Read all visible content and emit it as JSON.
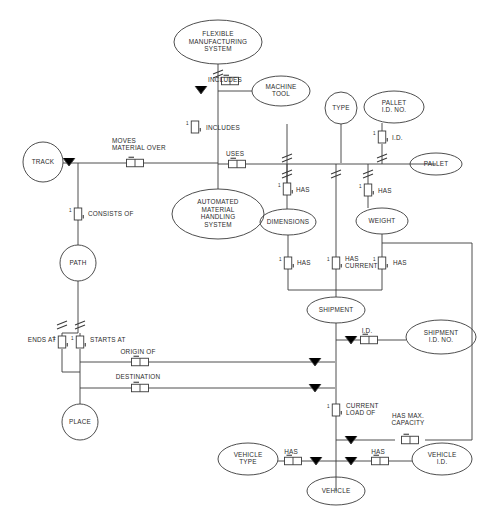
{
  "diagram": {
    "type": "entity-relationship-diagram",
    "notation": "NIAM / ORM fact-based model",
    "stroke_color": "#3a3a3a",
    "background_color": "#ffffff",
    "entities": [
      {
        "id": "fms",
        "label": "FLEXIBLE\nMANUFACTURING\nSYSTEM",
        "lines": [
          "FLEXIBLE",
          "MANUFACTURING",
          "SYSTEM"
        ],
        "shape": "ellipse",
        "cx": 218,
        "cy": 42,
        "rx": 44,
        "ry": 22
      },
      {
        "id": "machine_tool",
        "label": "MACHINE\nTOOL",
        "lines": [
          "MACHINE",
          "TOOL"
        ],
        "shape": "ellipse",
        "cx": 281,
        "cy": 91,
        "rx": 29,
        "ry": 15
      },
      {
        "id": "track",
        "label": "TRACK",
        "lines": [
          "TRACK"
        ],
        "shape": "circle",
        "cx": 43,
        "cy": 162,
        "rx": 20,
        "ry": 20
      },
      {
        "id": "amhs",
        "label": "AUTOMATED\nMATERIAL\nHANDLING\nSYSTEM",
        "lines": [
          "AUTOMATED",
          "MATERIAL",
          "HANDLING",
          "SYSTEM"
        ],
        "shape": "ellipse",
        "cx": 218,
        "cy": 214,
        "rx": 46,
        "ry": 25
      },
      {
        "id": "path",
        "label": "PATH",
        "lines": [
          "PATH"
        ],
        "shape": "circle",
        "cx": 78,
        "cy": 263,
        "rx": 18,
        "ry": 18
      },
      {
        "id": "place",
        "label": "PLACE",
        "lines": [
          "PLACE"
        ],
        "shape": "circle",
        "cx": 80,
        "cy": 422,
        "rx": 18,
        "ry": 18
      },
      {
        "id": "type",
        "label": "TYPE",
        "lines": [
          "TYPE"
        ],
        "shape": "circle",
        "cx": 341,
        "cy": 108,
        "rx": 16,
        "ry": 16
      },
      {
        "id": "pallet_id_no",
        "label": "PALLET\nI.D. NO.",
        "lines": [
          "PALLET",
          "I.D. NO."
        ],
        "shape": "ellipse",
        "cx": 394,
        "cy": 107,
        "rx": 30,
        "ry": 16
      },
      {
        "id": "pallet",
        "label": "PALLET",
        "lines": [
          "PALLET"
        ],
        "shape": "ellipse",
        "cx": 436,
        "cy": 164,
        "rx": 26,
        "ry": 11
      },
      {
        "id": "dimensions",
        "label": "DIMENSIONS",
        "lines": [
          "DIMENSIONS"
        ],
        "shape": "ellipse",
        "cx": 288,
        "cy": 222,
        "rx": 28,
        "ry": 13
      },
      {
        "id": "weight",
        "label": "WEIGHT",
        "lines": [
          "WEIGHT"
        ],
        "shape": "ellipse",
        "cx": 382,
        "cy": 221,
        "rx": 26,
        "ry": 13
      },
      {
        "id": "shipment",
        "label": "SHIPMENT",
        "lines": [
          "SHIPMENT"
        ],
        "shape": "ellipse",
        "cx": 336,
        "cy": 310,
        "rx": 29,
        "ry": 13
      },
      {
        "id": "shipment_id_no",
        "label": "SHIPMENT\nI.D. NO.",
        "lines": [
          "SHIPMENT",
          "I.D. NO."
        ],
        "shape": "ellipse",
        "cx": 441,
        "cy": 337,
        "rx": 35,
        "ry": 17
      },
      {
        "id": "vehicle_type",
        "label": "VEHICLE\nTYPE",
        "lines": [
          "VEHICLE",
          "TYPE"
        ],
        "shape": "ellipse",
        "cx": 248,
        "cy": 459,
        "rx": 30,
        "ry": 16
      },
      {
        "id": "vehicle_id",
        "label": "VEHICLE\nI.D.",
        "lines": [
          "VEHICLE",
          "I.D."
        ],
        "shape": "ellipse",
        "cx": 442,
        "cy": 459,
        "rx": 30,
        "ry": 16
      },
      {
        "id": "vehicle",
        "label": "VEHICLE",
        "lines": [
          "VEHICLE"
        ],
        "shape": "ellipse",
        "cx": 336,
        "cy": 491,
        "rx": 29,
        "ry": 14
      }
    ],
    "predicates": [
      {
        "id": "includes_machine_tool",
        "label": "INCLUDES",
        "lines": [
          "INCLUDES"
        ],
        "x": 230,
        "y": 81,
        "label_x": 225,
        "label_y": 80,
        "anchor": "middle",
        "boxes": 2,
        "orient": "h"
      },
      {
        "id": "includes_amhs",
        "label": "INCLUDES",
        "lines": [
          "INCLUDES"
        ],
        "x": 195,
        "y": 127,
        "label_x": 206,
        "label_y": 128,
        "anchor": "start",
        "boxes": 1,
        "orient": "v"
      },
      {
        "id": "moves_material_over",
        "label": "MOVES\nMATERIAL OVER",
        "lines": [
          "MOVES",
          "MATERIAL  OVER"
        ],
        "x": 135,
        "y": 163,
        "label_x": 112,
        "label_y": 145,
        "anchor": "start",
        "boxes": 2,
        "orient": "h"
      },
      {
        "id": "uses",
        "label": "USES",
        "lines": [
          "USES"
        ],
        "x": 237,
        "y": 164,
        "label_x": 235,
        "label_y": 154,
        "anchor": "middle",
        "boxes": 2,
        "orient": "h"
      },
      {
        "id": "consists_of",
        "label": "CONSISTS OF",
        "lines": [
          "CONSISTS OF"
        ],
        "x": 78,
        "y": 214,
        "label_x": 88,
        "label_y": 214,
        "anchor": "start",
        "boxes": 1,
        "orient": "v"
      },
      {
        "id": "has_type",
        "label": "HAS",
        "lines": [
          "HAS"
        ],
        "x": 287,
        "y": 189,
        "label_x": 296,
        "label_y": 190,
        "anchor": "start",
        "boxes": 1,
        "orient": "v"
      },
      {
        "id": "has_id",
        "label": "I.D.",
        "lines": [
          "I.D."
        ],
        "x": 382,
        "y": 137,
        "label_x": 392,
        "label_y": 138,
        "anchor": "start",
        "boxes": 1,
        "orient": "v"
      },
      {
        "id": "has_weight",
        "label": "HAS",
        "lines": [
          "HAS"
        ],
        "x": 368,
        "y": 190,
        "label_x": 378,
        "label_y": 191,
        "anchor": "start",
        "boxes": 1,
        "orient": "v"
      },
      {
        "id": "has_dimensions",
        "label": "HAS",
        "lines": [
          "HAS"
        ],
        "x": 288,
        "y": 263,
        "label_x": 297,
        "label_y": 263,
        "anchor": "start",
        "boxes": 1,
        "orient": "v"
      },
      {
        "id": "has_current",
        "label": "HAS\nCURRENT",
        "lines": [
          "HAS",
          "CURRENT"
        ],
        "x": 336,
        "y": 263,
        "label_x": 345,
        "label_y": 263,
        "anchor": "start",
        "boxes": 1,
        "orient": "v"
      },
      {
        "id": "has_weight_2",
        "label": "HAS",
        "lines": [
          "HAS"
        ],
        "x": 382,
        "y": 263,
        "label_x": 393,
        "label_y": 263,
        "anchor": "start",
        "boxes": 1,
        "orient": "v"
      },
      {
        "id": "shipment_id",
        "label": "I.D.",
        "lines": [
          "I.D."
        ],
        "x": 369,
        "y": 340,
        "label_x": 367,
        "label_y": 331,
        "anchor": "middle",
        "boxes": 2,
        "orient": "h"
      },
      {
        "id": "ends_at",
        "label": "ENDS AT",
        "lines": [
          "ENDS AT"
        ],
        "x": 62,
        "y": 342,
        "label_x": 56,
        "label_y": 340,
        "anchor": "end",
        "boxes": 1,
        "orient": "v"
      },
      {
        "id": "starts_at",
        "label": "STARTS AT",
        "lines": [
          "STARTS AT"
        ],
        "x": 80,
        "y": 342,
        "label_x": 90,
        "label_y": 340,
        "anchor": "start",
        "boxes": 1,
        "orient": "v"
      },
      {
        "id": "origin_of",
        "label": "ORIGIN OF",
        "lines": [
          "ORIGIN  OF"
        ],
        "x": 140,
        "y": 362,
        "label_x": 138,
        "label_y": 352,
        "anchor": "middle",
        "boxes": 2,
        "orient": "h"
      },
      {
        "id": "destination",
        "label": "DESTINATION",
        "lines": [
          "DESTINATION"
        ],
        "x": 140,
        "y": 388,
        "label_x": 138,
        "label_y": 377,
        "anchor": "middle",
        "boxes": 2,
        "orient": "h"
      },
      {
        "id": "current_load_of",
        "label": "CURRENT\nLOAD OF",
        "lines": [
          "CURRENT",
          "LOAD  OF"
        ],
        "x": 336,
        "y": 410,
        "label_x": 346,
        "label_y": 410,
        "anchor": "start",
        "boxes": 1,
        "orient": "v"
      },
      {
        "id": "has_max_capacity",
        "label": "HAS MAX.\nCAPACITY",
        "lines": [
          "HAS MAX.",
          "CAPACITY"
        ],
        "x": 410,
        "y": 440,
        "label_x": 408,
        "label_y": 420,
        "anchor": "middle",
        "boxes": 2,
        "orient": "h"
      },
      {
        "id": "has_vehicle_type",
        "label": "HAS",
        "lines": [
          "HAS"
        ],
        "x": 293,
        "y": 461,
        "label_x": 291,
        "label_y": 452,
        "anchor": "middle",
        "boxes": 2,
        "orient": "h"
      },
      {
        "id": "has_vehicle_id",
        "label": "HAS",
        "lines": [
          "HAS"
        ],
        "x": 380,
        "y": 461,
        "label_x": 378,
        "label_y": 452,
        "anchor": "middle",
        "boxes": 2,
        "orient": "h"
      }
    ],
    "legend_notes": {
      "mandatory_marker": "V",
      "uniqueness_marker": "|",
      "cardinality_one": "1"
    }
  }
}
